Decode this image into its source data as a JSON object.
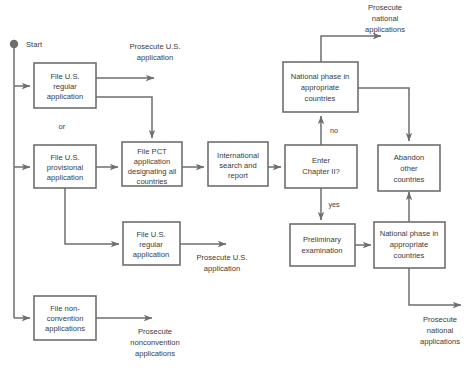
{
  "diagram": {
    "colors": {
      "stroke": "#6e6e6e",
      "text": "#3a3a3a",
      "background": "#ffffff"
    },
    "start": {
      "label": "Start"
    },
    "nodes": {
      "file_us_regular_1": {
        "lines": [
          "File U.S.",
          "regular",
          "application"
        ]
      },
      "file_us_provisional": {
        "lines": [
          "File U.S.",
          "provisional",
          "application"
        ]
      },
      "file_us_regular_2": {
        "lines": [
          "File U.S.",
          "regular",
          "application"
        ]
      },
      "file_nonconvention": {
        "lines": [
          "File non-",
          "convention",
          "applications"
        ]
      },
      "file_pct": {
        "lines": [
          "File PCT",
          "application",
          "designating all",
          "countries"
        ]
      },
      "international_search": {
        "lines": [
          "International",
          "search and",
          "report"
        ]
      },
      "enter_chapter_ii": {
        "lines": [
          "Enter",
          "Chapter II?"
        ]
      },
      "national_phase_top": {
        "lines": [
          "National phase in",
          "appropriate",
          "countries"
        ]
      },
      "abandon_other": {
        "lines": [
          "Abandon",
          "other",
          "countries"
        ]
      },
      "preliminary_exam": {
        "lines": [
          "Preliminary",
          "examination"
        ]
      },
      "national_phase_bottom": {
        "lines": [
          "National phase in",
          "appropriate",
          "countries"
        ]
      }
    },
    "labels": {
      "or": "or",
      "prosecute_us_top": [
        "Prosecute U.S.",
        "application"
      ],
      "prosecute_us_mid": [
        "Prosecute U.S.",
        "application"
      ],
      "prosecute_nonconvention": [
        "Prosecute",
        "nonconvention",
        "applications"
      ],
      "prosecute_national_top": [
        "Prosecute",
        "national",
        "applications"
      ],
      "prosecute_national_bottom": [
        "Prosecute",
        "national",
        "applications"
      ]
    },
    "edge_labels": {
      "no": "no",
      "yes": "yes"
    }
  }
}
